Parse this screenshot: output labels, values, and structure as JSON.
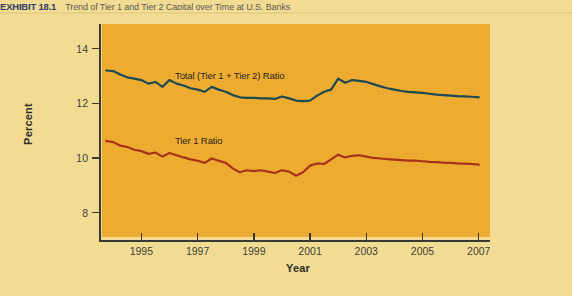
{
  "caption": {
    "label": "EXHIBIT 18.1",
    "text": "Trend of Tier 1 and Tier 2 Capital over Time at U.S. Banks"
  },
  "chart_data": {
    "type": "line",
    "title": "Trend of Tier 1 and Tier 2 Capital over Time at U.S. Banks",
    "xlabel": "Year",
    "ylabel": "Percent",
    "xlim": [
      1993.6,
      2007.4
    ],
    "ylim": [
      7.0,
      14.9
    ],
    "xticks": [
      1995,
      1997,
      1999,
      2001,
      2003,
      2005,
      2007
    ],
    "xtick_labels": [
      "1995",
      "1997",
      "1999",
      "2001",
      "2003",
      "2005",
      "2007"
    ],
    "yticks": [
      8,
      10,
      12,
      14
    ],
    "ytick_labels": [
      "8",
      "10",
      "12",
      "14"
    ],
    "grid": false,
    "legend_position": "inline-annotation",
    "panel_color": "#eeab2e",
    "background_color": "#f2dc94",
    "series": [
      {
        "name": "Total (Tier 1 + Tier 2) Ratio",
        "color": "#1d4a52",
        "annotation": "Total (Tier 1 + Tier 2) Ratio",
        "x": [
          1993.75,
          1994.0,
          1994.25,
          1994.5,
          1994.75,
          1995.0,
          1995.25,
          1995.5,
          1995.75,
          1996.0,
          1996.25,
          1996.5,
          1996.75,
          1997.0,
          1997.25,
          1997.5,
          1997.75,
          1998.0,
          1998.25,
          1998.5,
          1998.75,
          1999.0,
          1999.25,
          1999.5,
          1999.75,
          2000.0,
          2000.25,
          2000.5,
          2000.75,
          2001.0,
          2001.25,
          2001.5,
          2001.75,
          2002.0,
          2002.25,
          2002.5,
          2002.75,
          2003.0,
          2003.25,
          2003.5,
          2003.75,
          2004.0,
          2004.25,
          2004.5,
          2004.75,
          2005.0,
          2005.25,
          2005.5,
          2005.75,
          2006.0,
          2006.25,
          2006.5,
          2006.75,
          2007.0
        ],
        "y": [
          13.2,
          13.18,
          13.05,
          12.95,
          12.9,
          12.85,
          12.72,
          12.78,
          12.6,
          12.85,
          12.72,
          12.65,
          12.55,
          12.5,
          12.42,
          12.6,
          12.5,
          12.42,
          12.3,
          12.22,
          12.2,
          12.2,
          12.18,
          12.18,
          12.16,
          12.25,
          12.18,
          12.1,
          12.08,
          12.1,
          12.28,
          12.42,
          12.5,
          12.9,
          12.75,
          12.85,
          12.82,
          12.78,
          12.7,
          12.62,
          12.55,
          12.5,
          12.45,
          12.42,
          12.4,
          12.38,
          12.35,
          12.32,
          12.3,
          12.28,
          12.26,
          12.25,
          12.24,
          12.22
        ]
      },
      {
        "name": "Tier 1 Ratio",
        "color": "#a8311a",
        "annotation": "Tier 1 Ratio",
        "x": [
          1993.75,
          1994.0,
          1994.25,
          1994.5,
          1994.75,
          1995.0,
          1995.25,
          1995.5,
          1995.75,
          1996.0,
          1996.25,
          1996.5,
          1996.75,
          1997.0,
          1997.25,
          1997.5,
          1997.75,
          1998.0,
          1998.25,
          1998.5,
          1998.75,
          1999.0,
          1999.25,
          1999.5,
          1999.75,
          2000.0,
          2000.25,
          2000.5,
          2000.75,
          2001.0,
          2001.25,
          2001.5,
          2001.75,
          2002.0,
          2002.25,
          2002.5,
          2002.75,
          2003.0,
          2003.25,
          2003.5,
          2003.75,
          2004.0,
          2004.25,
          2004.5,
          2004.75,
          2005.0,
          2005.25,
          2005.5,
          2005.75,
          2006.0,
          2006.25,
          2006.5,
          2006.75,
          2007.0
        ],
        "y": [
          10.62,
          10.58,
          10.45,
          10.4,
          10.3,
          10.25,
          10.15,
          10.2,
          10.05,
          10.18,
          10.1,
          10.02,
          9.95,
          9.9,
          9.82,
          9.98,
          9.9,
          9.82,
          9.62,
          9.48,
          9.55,
          9.52,
          9.55,
          9.5,
          9.45,
          9.55,
          9.5,
          9.35,
          9.48,
          9.72,
          9.8,
          9.78,
          9.95,
          10.12,
          10.02,
          10.08,
          10.1,
          10.05,
          10.0,
          9.98,
          9.96,
          9.94,
          9.92,
          9.9,
          9.9,
          9.88,
          9.86,
          9.85,
          9.83,
          9.82,
          9.8,
          9.79,
          9.78,
          9.76
        ]
      }
    ]
  }
}
